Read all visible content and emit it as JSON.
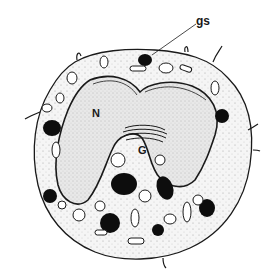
{
  "figure": {
    "labels": {
      "granule": "gs",
      "nucleus": "N",
      "golgi": "G"
    },
    "colors": {
      "background": "#ffffff",
      "ink": "#1a1a1a",
      "cytoplasm": "#f4f4f4",
      "nucleus_fill": "#e6e6e6",
      "granule_fill": "#0d0d0d"
    }
  }
}
